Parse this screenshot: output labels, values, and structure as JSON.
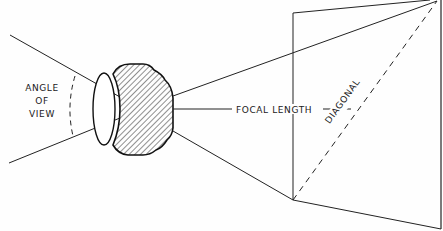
{
  "diagram": {
    "title": "",
    "labels": {
      "angle_line1": "ANGLE",
      "angle_line2": "OF",
      "angle_line3": "VIEW",
      "focal_length": "FOCAL LENGTH",
      "diagonal": "DIAGONAL"
    },
    "elements": [
      "lens",
      "angle-of-view arc",
      "focal length dimension line",
      "film plane rectangle (perspective)",
      "diagonal dashed line"
    ],
    "colors": {
      "ink": "#1a1a1a",
      "background": "#fefefe"
    }
  }
}
